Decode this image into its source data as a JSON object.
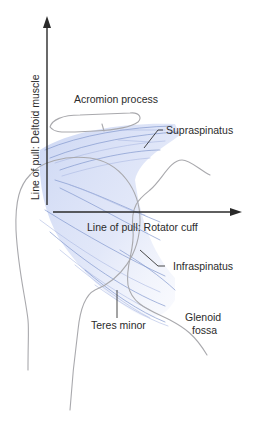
{
  "diagram": {
    "axes": {
      "vertical": {
        "label": "Line of pull: Deltoid muscle",
        "direction": "up"
      },
      "horizontal": {
        "label": "Line of pull: Rotator cuff",
        "direction": "right"
      }
    },
    "labels": {
      "acromion": "Acromion process",
      "supraspinatus": "Supraspinatus",
      "infraspinatus": "Infraspinatus",
      "teres_minor": "Teres minor",
      "glenoid_line1": "Glenoid",
      "glenoid_line2": "fossa"
    },
    "colors": {
      "muscle_fill": "#c9d4f2",
      "muscle_fiber": "#7f95cc",
      "bone_outline": "#a9a9ad",
      "arrow": "#2a2a2a",
      "text": "#2b2b2b"
    }
  }
}
